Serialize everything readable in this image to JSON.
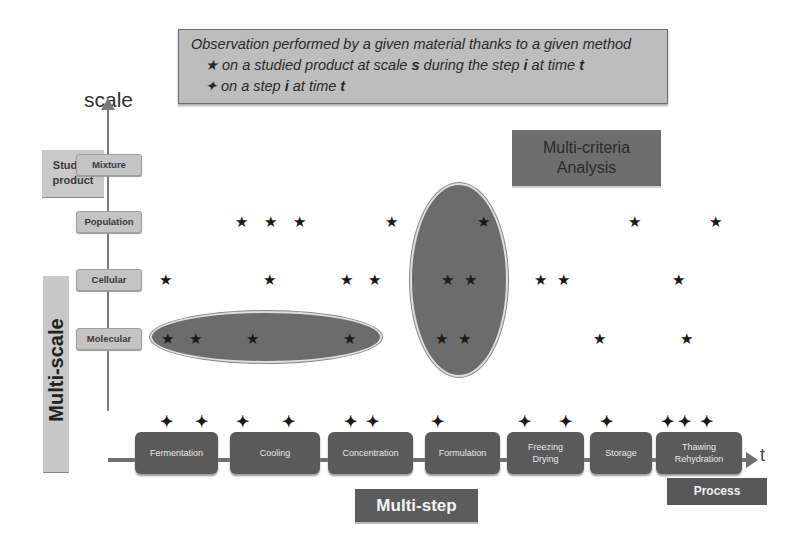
{
  "legend": {
    "title": "Observation performed by a given material thanks to a given method",
    "star_symbol": "★",
    "star_text_1": "on a studied product at scale ",
    "star_s": "s",
    "star_text_2": " during the step ",
    "star_i": "i",
    "star_text_3": " at time ",
    "star_t": "t",
    "plus_symbol": "✦",
    "plus_text_1": "on a step ",
    "plus_i": "i",
    "plus_text_2": " at time ",
    "plus_t": "t"
  },
  "axis": {
    "y_label": "scale",
    "x_label": "t",
    "studied_product": "Studied product",
    "multiscale": "Multi-scale"
  },
  "scales": [
    {
      "label": "Mixture",
      "y": 165
    },
    {
      "label": "Population",
      "y": 222
    },
    {
      "label": "Cellular",
      "y": 280
    },
    {
      "label": "Molecular",
      "y": 339
    }
  ],
  "multi_criteria": {
    "line1": "Multi-criteria",
    "line2": "Analysis"
  },
  "steps": [
    {
      "label": "Fermentation",
      "x": 135,
      "w": 83
    },
    {
      "label": "Cooling",
      "x": 230,
      "w": 90
    },
    {
      "label": "Concentration",
      "x": 328,
      "w": 85
    },
    {
      "label": "Formulation",
      "x": 425,
      "w": 75
    },
    {
      "label": "Freezing\nDrying",
      "x": 507,
      "w": 77
    },
    {
      "label": "Storage",
      "x": 590,
      "w": 62
    },
    {
      "label": "Thawing\nRehydration",
      "x": 656,
      "w": 86
    }
  ],
  "multistep_label": "Multi-step",
  "process_label": "Process",
  "stars": [
    {
      "x": 241,
      "y": 222
    },
    {
      "x": 270,
      "y": 222
    },
    {
      "x": 299,
      "y": 222
    },
    {
      "x": 391,
      "y": 222
    },
    {
      "x": 483,
      "y": 222
    },
    {
      "x": 634,
      "y": 222
    },
    {
      "x": 715,
      "y": 222
    },
    {
      "x": 165,
      "y": 280
    },
    {
      "x": 269,
      "y": 280
    },
    {
      "x": 346,
      "y": 280
    },
    {
      "x": 374,
      "y": 280
    },
    {
      "x": 447,
      "y": 280
    },
    {
      "x": 470,
      "y": 280
    },
    {
      "x": 540,
      "y": 280
    },
    {
      "x": 563,
      "y": 280
    },
    {
      "x": 678,
      "y": 280
    },
    {
      "x": 167,
      "y": 339
    },
    {
      "x": 195,
      "y": 339
    },
    {
      "x": 252,
      "y": 339
    },
    {
      "x": 349,
      "y": 339
    },
    {
      "x": 441,
      "y": 339
    },
    {
      "x": 464,
      "y": 339
    },
    {
      "x": 599,
      "y": 339
    },
    {
      "x": 686,
      "y": 339
    }
  ],
  "pluses": [
    166,
    201,
    242,
    288,
    350,
    372,
    437,
    524,
    565,
    606,
    667,
    684,
    706
  ],
  "plus_y": 422,
  "colors": {
    "box_grey": "#bdbdbd",
    "dark_grey": "#5a5a5a",
    "ellipse": "#6c6c6c"
  }
}
